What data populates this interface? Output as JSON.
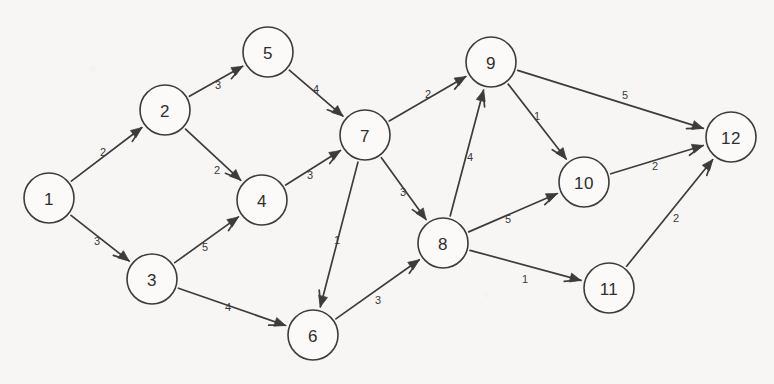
{
  "diagram": {
    "type": "weighted-directed-graph",
    "background_color": "#f7f6f4",
    "stroke_color": "#3c3c3c",
    "node_fill": "#fbfaf8",
    "node_radius": 25,
    "width": 774,
    "height": 384
  },
  "nodes": [
    {
      "id": "1",
      "label": "1",
      "x": 49,
      "y": 198
    },
    {
      "id": "2",
      "label": "2",
      "x": 165,
      "y": 110
    },
    {
      "id": "3",
      "label": "3",
      "x": 152,
      "y": 279
    },
    {
      "id": "4",
      "label": "4",
      "x": 262,
      "y": 200
    },
    {
      "id": "5",
      "label": "5",
      "x": 268,
      "y": 52
    },
    {
      "id": "6",
      "label": "6",
      "x": 313,
      "y": 335
    },
    {
      "id": "7",
      "label": "7",
      "x": 365,
      "y": 135
    },
    {
      "id": "8",
      "label": "8",
      "x": 443,
      "y": 243
    },
    {
      "id": "9",
      "label": "9",
      "x": 491,
      "y": 62
    },
    {
      "id": "10",
      "label": "10",
      "x": 584,
      "y": 182
    },
    {
      "id": "11",
      "label": "11",
      "x": 609,
      "y": 288
    },
    {
      "id": "12",
      "label": "12",
      "x": 731,
      "y": 137
    }
  ],
  "edges": [
    {
      "from": "1",
      "to": "2",
      "weight": "2",
      "lx": 103,
      "ly": 152
    },
    {
      "from": "1",
      "to": "3",
      "weight": "3",
      "lx": 97,
      "ly": 241
    },
    {
      "from": "2",
      "to": "5",
      "weight": "3",
      "lx": 218,
      "ly": 85
    },
    {
      "from": "2",
      "to": "4",
      "weight": "2",
      "lx": 217,
      "ly": 170
    },
    {
      "from": "3",
      "to": "4",
      "weight": "5",
      "lx": 205,
      "ly": 247
    },
    {
      "from": "3",
      "to": "6",
      "weight": "4",
      "lx": 228,
      "ly": 307
    },
    {
      "from": "5",
      "to": "7",
      "weight": "4",
      "lx": 316,
      "ly": 89
    },
    {
      "from": "4",
      "to": "7",
      "weight": "3",
      "lx": 310,
      "ly": 175
    },
    {
      "from": "7",
      "to": "9",
      "weight": "2",
      "lx": 428,
      "ly": 94
    },
    {
      "from": "7",
      "to": "8",
      "weight": "3",
      "lx": 403,
      "ly": 192
    },
    {
      "from": "7",
      "to": "6",
      "weight": "1",
      "lx": 337,
      "ly": 240
    },
    {
      "from": "6",
      "to": "8",
      "weight": "3",
      "lx": 378,
      "ly": 300
    },
    {
      "from": "8",
      "to": "9",
      "weight": "4",
      "lx": 470,
      "ly": 157
    },
    {
      "from": "8",
      "to": "10",
      "weight": "5",
      "lx": 508,
      "ly": 219
    },
    {
      "from": "8",
      "to": "11",
      "weight": "1",
      "lx": 525,
      "ly": 279
    },
    {
      "from": "9",
      "to": "12",
      "weight": "5",
      "lx": 625,
      "ly": 95
    },
    {
      "from": "9",
      "to": "10",
      "weight": "1",
      "lx": 537,
      "ly": 116
    },
    {
      "from": "10",
      "to": "12",
      "weight": "2",
      "lx": 655,
      "ly": 166
    },
    {
      "from": "11",
      "to": "12",
      "weight": "2",
      "lx": 676,
      "ly": 218
    }
  ]
}
